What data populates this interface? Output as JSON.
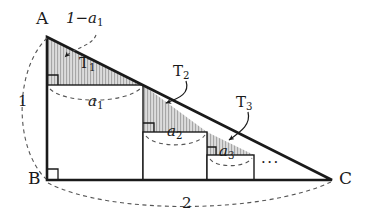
{
  "figure": {
    "type": "geometry-diagram",
    "colors": {
      "stroke": "#1a1a1a",
      "dashed": "#555555",
      "shade_fill": "#d8d8d8",
      "hatch": "#8c8c8c",
      "background": "#ffffff"
    }
  },
  "vertices": {
    "a": "A",
    "b": "B",
    "c": "C"
  },
  "dimensions": {
    "leg_ab": "1",
    "base_bc": "2",
    "top_segment": "1−a",
    "top_segment_sub": "1"
  },
  "triangles": [
    {
      "label": "T",
      "sub": "1"
    },
    {
      "label": "T",
      "sub": "2"
    },
    {
      "label": "T",
      "sub": "3"
    }
  ],
  "squares": [
    {
      "label": "a",
      "sub": "1"
    },
    {
      "label": "a",
      "sub": "2"
    },
    {
      "label": "a",
      "sub": "3"
    }
  ],
  "ellipsis": "···",
  "geometry": {
    "A": [
      47,
      37
    ],
    "B": [
      47,
      180
    ],
    "C": [
      332,
      180
    ],
    "square1": [
      47,
      85,
      96
    ],
    "square2": [
      143,
      132,
      64
    ],
    "square3": [
      207,
      153,
      47
    ]
  }
}
